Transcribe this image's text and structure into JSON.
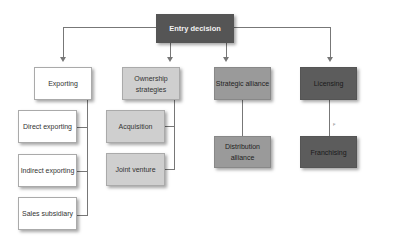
{
  "diagram": {
    "root": {
      "label": "Entry decision",
      "color": "#555555"
    },
    "branches": [
      {
        "label": "Exporting",
        "fill": "#ffffff",
        "children": [
          "Direct exporting",
          "Indirect exporting",
          "Sales subsidiary"
        ]
      },
      {
        "label": "Ownership strategies",
        "fill": "#cfcfcf",
        "children": [
          "Acquisition",
          "Joint venture"
        ]
      },
      {
        "label": "Strategic alliance",
        "fill": "#9a9a9a",
        "children": [
          "Distribution alliance"
        ]
      },
      {
        "label": "Licensing",
        "fill": "#5c5c5c",
        "children": [
          "Franchising"
        ]
      }
    ],
    "marks": {
      "small_f": "F"
    }
  }
}
